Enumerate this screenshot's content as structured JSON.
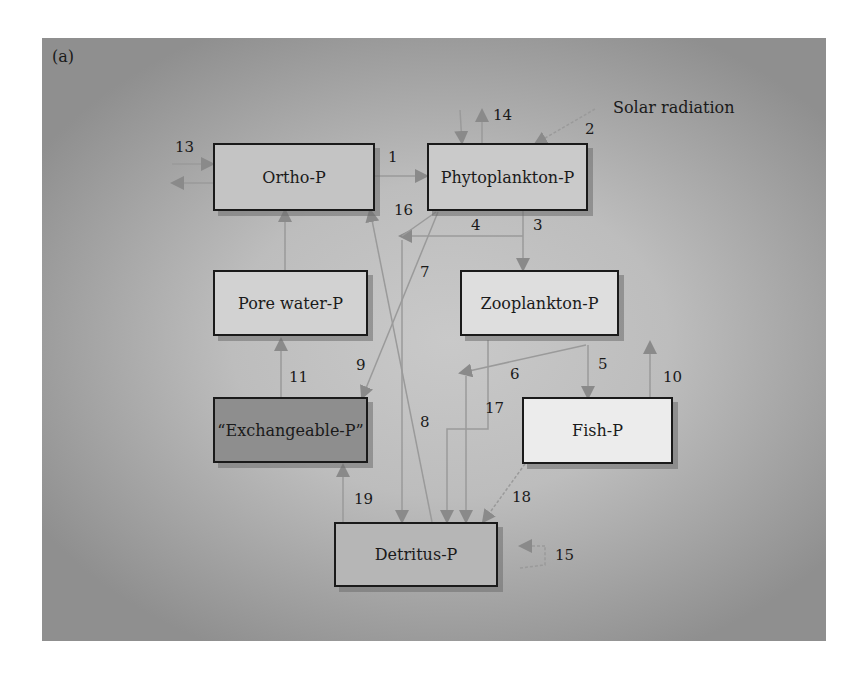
{
  "figure": {
    "panel_label": "(a)",
    "external_label": "Solar radiation"
  },
  "compartments": [
    {
      "id": "ortho",
      "label": "Ortho-P",
      "fill": "#c4c4c4"
    },
    {
      "id": "phyto",
      "label": "Phytoplankton-P",
      "fill": "#cacaca"
    },
    {
      "id": "zoo",
      "label": "Zooplankton-P",
      "fill": "#dedede"
    },
    {
      "id": "pore",
      "label": "Pore water-P",
      "fill": "#d2d2d2"
    },
    {
      "id": "exch",
      "label": "“Exchangeable-P”",
      "fill": "#8e8e8e"
    },
    {
      "id": "fish",
      "label": "Fish-P",
      "fill": "#ececec"
    },
    {
      "id": "detritus",
      "label": "Detritus-P",
      "fill": "#b6b6b6"
    }
  ],
  "flows": [
    {
      "label": "1",
      "from": "Ortho-P",
      "to": "Phytoplankton-P"
    },
    {
      "label": "2",
      "from": "Solar radiation",
      "to": "Phytoplankton-P"
    },
    {
      "label": "3",
      "from": "Phytoplankton-P",
      "to": "Zooplankton-P"
    },
    {
      "label": "4",
      "from": "Phytoplankton-P",
      "to": "Detritus-P"
    },
    {
      "label": "5",
      "from": "Zooplankton-P",
      "to": "Fish-P"
    },
    {
      "label": "6",
      "from": "Zooplankton-P",
      "to": "Detritus-P"
    },
    {
      "label": "7",
      "from": "Phytoplankton-P",
      "to": "Exchangeable-P"
    },
    {
      "label": "8",
      "from": "Detritus-P",
      "to": "Ortho-P"
    },
    {
      "label": "9",
      "from": "Phytoplankton-P",
      "to": "Exchangeable-P"
    },
    {
      "label": "10",
      "from": "Fish-P",
      "to": "outside"
    },
    {
      "label": "11",
      "from": "Exchangeable-P",
      "to": "Pore water-P"
    },
    {
      "label": "13",
      "from": "outside",
      "to": "Ortho-P"
    },
    {
      "label": "14",
      "from": "outside",
      "to": "Phytoplankton-P"
    },
    {
      "label": "15",
      "from": "Detritus-P",
      "to": "outside"
    },
    {
      "label": "16",
      "from": "Phytoplankton-P",
      "to": "Detritus-P"
    },
    {
      "label": "17",
      "from": "Zooplankton-P",
      "to": "Detritus-P"
    },
    {
      "label": "18",
      "from": "Fish-P",
      "to": "Detritus-P"
    },
    {
      "label": "19",
      "from": "Detritus-P",
      "to": "Exchangeable-P"
    }
  ],
  "colors": {
    "arrow": "#8a8a8a",
    "line": "#9a9a9a",
    "border": "#1a1a1a"
  }
}
